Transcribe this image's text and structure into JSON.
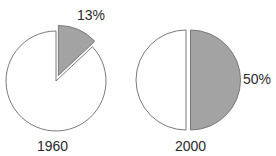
{
  "chart_data": {
    "type": "pie",
    "title": "",
    "charts": [
      {
        "name": "pie-1960",
        "year_label": "1960",
        "highlight_label": "13%",
        "slices": [
          {
            "label": "highlighted",
            "value": 13,
            "color": "#a3a3a3",
            "exploded": true
          },
          {
            "label": "other",
            "value": 87,
            "color": "#ffffff",
            "exploded": false
          }
        ]
      },
      {
        "name": "pie-2000",
        "year_label": "2000",
        "highlight_label": "50%",
        "slices": [
          {
            "label": "highlighted",
            "value": 50,
            "color": "#a3a3a3",
            "exploded": true
          },
          {
            "label": "other",
            "value": 50,
            "color": "#ffffff",
            "exploded": false
          }
        ]
      }
    ],
    "legend": null,
    "grid": false
  },
  "colors": {
    "highlight_fill": "#a3a3a3",
    "base_fill": "#ffffff",
    "outline": "#7a7a7a",
    "text": "#2a2a2a"
  },
  "labels": {
    "pie1_year": "1960",
    "pie1_pct": "13%",
    "pie2_year": "2000",
    "pie2_pct": "50%"
  }
}
